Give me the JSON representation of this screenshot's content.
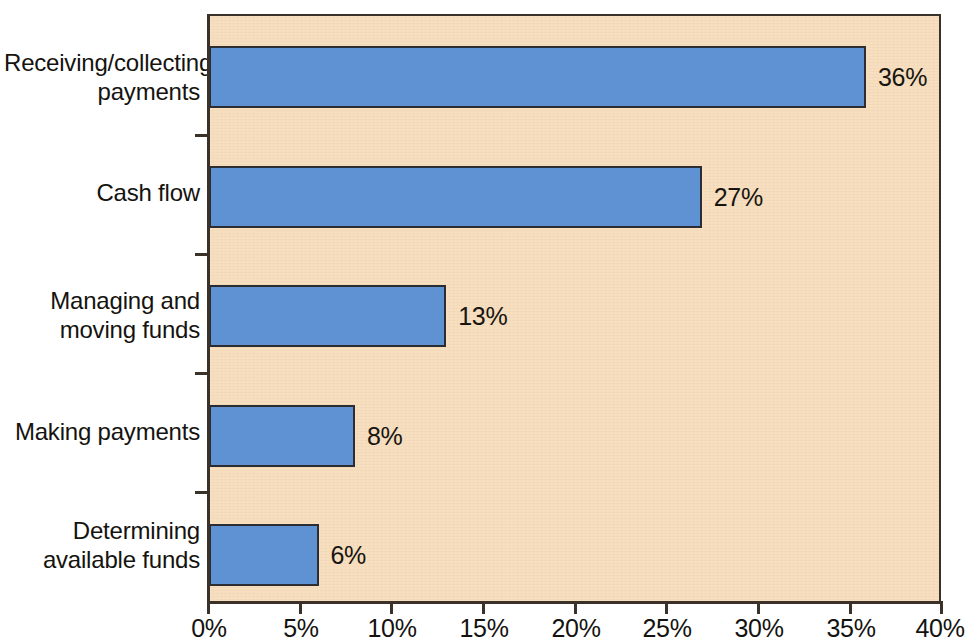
{
  "chart_data": {
    "type": "bar",
    "orientation": "horizontal",
    "title": "",
    "subtitle": "",
    "xlabel": "",
    "ylabel": "",
    "xlim": [
      0,
      40
    ],
    "grid": false,
    "legend": null,
    "categories": [
      "Receiving/collecting payments",
      "Cash flow",
      "Managing and moving funds",
      "Making payments",
      "Determining available funds"
    ],
    "values": [
      36,
      27,
      13,
      8,
      6
    ],
    "value_labels": [
      "36%",
      "27%",
      "13%",
      "8%",
      "6%"
    ],
    "xticks": [
      0,
      5,
      10,
      15,
      20,
      25,
      30,
      35,
      40
    ],
    "xtick_labels": [
      "0%",
      "5%",
      "10%",
      "15%",
      "20%",
      "25%",
      "30%",
      "35%",
      "40%"
    ],
    "colors": {
      "bar_fill": "#5d92d6",
      "bar_border": "#2a2a33",
      "plot_background": "#f7dfc0",
      "axis": "#3a3128",
      "text": "#14120f",
      "page_background": "#ffffff"
    }
  },
  "categories_display": [
    {
      "line1": "Receiving/collecting",
      "line2": "payments"
    },
    {
      "line1": "Cash flow",
      "line2": ""
    },
    {
      "line1": "Managing and",
      "line2": "moving funds"
    },
    {
      "line1": "Making payments",
      "line2": ""
    },
    {
      "line1": "Determining",
      "line2": "available funds"
    }
  ]
}
